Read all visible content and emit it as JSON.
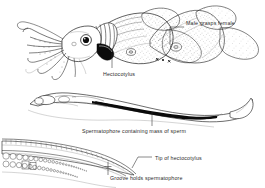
{
  "figure": {
    "background_color": "#ffffff",
    "ink_color": "#1d1d1d",
    "label_color": "#2b2b2b",
    "panels": [
      {
        "id": "panel-mating-pair",
        "name": "mating-squid-pair",
        "description": "Two squid, male grasping female, lateral view"
      },
      {
        "id": "panel-spermatophore",
        "name": "spermatophore-detail",
        "description": "Elongate spermatophore with dark sperm mass"
      },
      {
        "id": "panel-hectocotylus-tip",
        "name": "hectocotylus-tip-detail",
        "description": "Tip of modified arm showing suckers and groove"
      }
    ],
    "labels": [
      {
        "id": "male-grasps-female",
        "text": "Male grasps female",
        "x": 186,
        "y": 24
      },
      {
        "id": "hectocotylus",
        "text": "Hectocotylus",
        "x": 103,
        "y": 76
      },
      {
        "id": "spermatophore-containing-mass-of-sperm",
        "text": "Spermatophore containing mass of sperm",
        "x": 82,
        "y": 132
      },
      {
        "id": "tip-of-hectocotylus",
        "text": "Tip of hectocotylus",
        "x": 155,
        "y": 160
      },
      {
        "id": "groove-holds-spermatophore",
        "text": "Groove holds spermatophore",
        "x": 110,
        "y": 179
      }
    ]
  }
}
